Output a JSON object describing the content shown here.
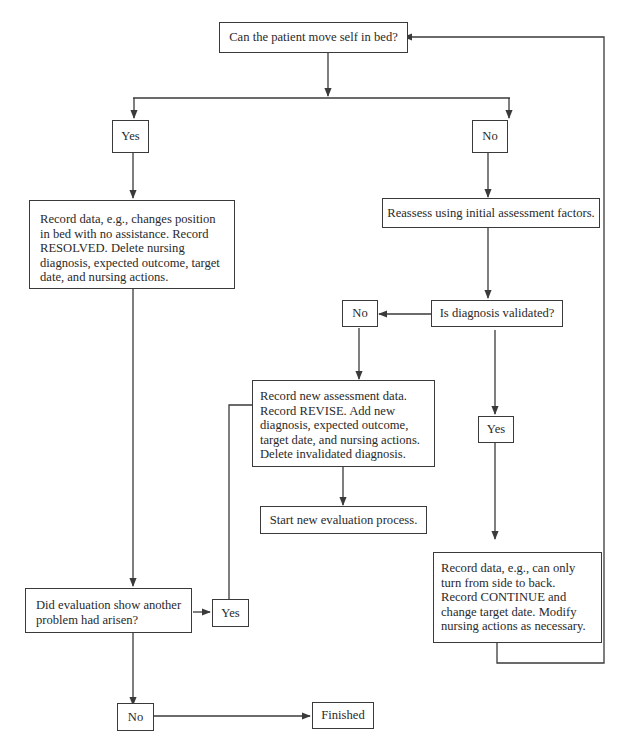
{
  "diagram": {
    "type": "flowchart",
    "nodes": {
      "start": {
        "text": "Can the patient move self in bed?"
      },
      "yes1": {
        "text": "Yes"
      },
      "no1": {
        "text": "No"
      },
      "resolved": {
        "lines": [
          "Record data, e.g., changes position",
          "in bed with no assistance. Record",
          "RESOLVED. Delete nursing",
          "diagnosis, expected outcome, target",
          "date, and nursing actions."
        ]
      },
      "reassess": {
        "text": "Reassess using initial assessment factors."
      },
      "validated": {
        "text": "Is diagnosis validated?"
      },
      "no2": {
        "text": "No"
      },
      "revise": {
        "lines": [
          "Record new assessment data.",
          "Record REVISE. Add new",
          "diagnosis, expected outcome,",
          "target date, and nursing actions.",
          "Delete invalidated diagnosis."
        ]
      },
      "start_new": {
        "text": "Start new evaluation process."
      },
      "yes2": {
        "text": "Yes"
      },
      "continue": {
        "lines": [
          "Record data, e.g., can only",
          "turn from side to back.",
          "Record CONTINUE and",
          "change target date. Modify",
          "nursing actions as necessary."
        ]
      },
      "another_problem": {
        "lines": [
          "Did evaluation show another",
          "problem had arisen?"
        ]
      },
      "yes3": {
        "text": "Yes"
      },
      "no3": {
        "text": "No"
      },
      "finished": {
        "text": "Finished"
      }
    },
    "edges": [
      {
        "from": "start",
        "to": "yes1"
      },
      {
        "from": "start",
        "to": "no1"
      },
      {
        "from": "yes1",
        "to": "resolved"
      },
      {
        "from": "no1",
        "to": "reassess"
      },
      {
        "from": "reassess",
        "to": "validated"
      },
      {
        "from": "validated",
        "to": "no2"
      },
      {
        "from": "validated",
        "to": "yes2"
      },
      {
        "from": "no2",
        "to": "revise"
      },
      {
        "from": "revise",
        "to": "start_new"
      },
      {
        "from": "yes2",
        "to": "continue"
      },
      {
        "from": "continue",
        "to": "start"
      },
      {
        "from": "resolved",
        "to": "another_problem"
      },
      {
        "from": "another_problem",
        "to": "yes3"
      },
      {
        "from": "yes3",
        "to": "revise"
      },
      {
        "from": "another_problem",
        "to": "no3"
      },
      {
        "from": "no3",
        "to": "finished"
      }
    ],
    "colors": {
      "line": "#3a3a3a",
      "text": "#2a2a2a",
      "background": "#ffffff"
    }
  }
}
